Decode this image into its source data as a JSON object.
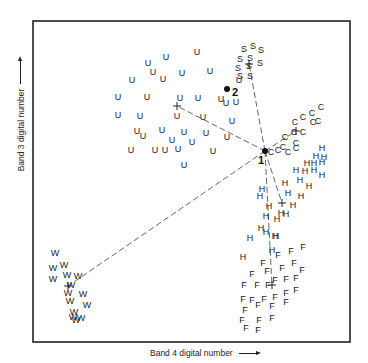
{
  "chart_data": {
    "type": "scatter",
    "title": "",
    "xlabel": "Band 4 digital number",
    "ylabel": "Band 3 digital number",
    "grid": false,
    "legend": null,
    "frame": {
      "left": 33,
      "top": 21,
      "right": 350,
      "bottom": 342
    },
    "series": [
      {
        "name": "U",
        "marker": "U",
        "centroid": [
          177,
          106
        ],
        "points": [
          [
            148,
            63
          ],
          [
            166,
            57
          ],
          [
            197,
            52
          ],
          [
            153,
            72
          ],
          [
            182,
            73
          ],
          [
            210,
            71
          ],
          [
            132,
            80
          ],
          [
            163,
            79
          ],
          [
            239,
            80
          ],
          [
            118,
            97
          ],
          [
            147,
            97
          ],
          [
            180,
            98
          ],
          [
            198,
            98
          ],
          [
            221,
            99
          ],
          [
            118,
            115
          ],
          [
            140,
            116
          ],
          [
            177,
            116
          ],
          [
            203,
            117
          ],
          [
            232,
            121
          ],
          [
            137,
            131
          ],
          [
            162,
            130
          ],
          [
            184,
            132
          ],
          [
            206,
            133
          ],
          [
            227,
            137
          ],
          [
            143,
            136
          ],
          [
            172,
            140
          ],
          [
            192,
            142
          ],
          [
            131,
            150
          ],
          [
            155,
            150
          ],
          [
            178,
            149
          ],
          [
            213,
            151
          ],
          [
            184,
            165
          ],
          [
            165,
            150
          ],
          [
            236,
            102
          ],
          [
            226,
            103
          ]
        ]
      },
      {
        "name": "S",
        "marker": "S",
        "centroid": [
          249,
          64
        ],
        "points": [
          [
            244,
            49
          ],
          [
            253,
            46
          ],
          [
            261,
            50
          ],
          [
            240,
            59
          ],
          [
            250,
            58
          ],
          [
            260,
            63
          ],
          [
            238,
            68
          ],
          [
            249,
            66
          ],
          [
            240,
            76
          ],
          [
            250,
            76
          ]
        ]
      },
      {
        "name": "C",
        "marker": "C",
        "centroid": [
          296,
          131
        ],
        "points": [
          [
            321,
            107
          ],
          [
            312,
            113
          ],
          [
            303,
            117
          ],
          [
            295,
            122
          ],
          [
            313,
            122
          ],
          [
            318,
            121
          ],
          [
            294,
            132
          ],
          [
            303,
            132
          ],
          [
            285,
            137
          ],
          [
            296,
            143
          ],
          [
            283,
            147
          ],
          [
            278,
            150
          ],
          [
            288,
            152
          ],
          [
            296,
            148
          ],
          [
            271,
            152
          ]
        ]
      },
      {
        "name": "H",
        "marker": "H",
        "centroid": [
          282,
          203
        ],
        "points": [
          [
            322,
            148
          ],
          [
            316,
            156
          ],
          [
            324,
            157
          ],
          [
            307,
            163
          ],
          [
            314,
            163
          ],
          [
            322,
            162
          ],
          [
            305,
            171
          ],
          [
            314,
            170
          ],
          [
            322,
            175
          ],
          [
            296,
            170
          ],
          [
            300,
            180
          ],
          [
            309,
            186
          ],
          [
            285,
            183
          ],
          [
            288,
            193
          ],
          [
            301,
            196
          ],
          [
            262,
            189
          ],
          [
            260,
            196
          ],
          [
            293,
            205
          ],
          [
            269,
            206
          ],
          [
            281,
            213
          ],
          [
            286,
            214
          ],
          [
            277,
            219
          ],
          [
            266,
            216
          ],
          [
            261,
            228
          ],
          [
            266,
            232
          ],
          [
            250,
            238
          ],
          [
            276,
            236
          ],
          [
            272,
            250
          ],
          [
            243,
            257
          ],
          [
            275,
            236
          ]
        ]
      },
      {
        "name": "F",
        "marker": "F",
        "centroid": [
          272,
          285
        ],
        "points": [
          [
            278,
            255
          ],
          [
            291,
            251
          ],
          [
            303,
            247
          ],
          [
            263,
            263
          ],
          [
            282,
            268
          ],
          [
            294,
            263
          ],
          [
            302,
            270
          ],
          [
            267,
            271
          ],
          [
            275,
            280
          ],
          [
            286,
            279
          ],
          [
            296,
            278
          ],
          [
            252,
            274
          ],
          [
            244,
            285
          ],
          [
            257,
            285
          ],
          [
            268,
            285
          ],
          [
            252,
            300
          ],
          [
            264,
            299
          ],
          [
            275,
            297
          ],
          [
            286,
            293
          ],
          [
            296,
            290
          ],
          [
            243,
            299
          ],
          [
            245,
            310
          ],
          [
            258,
            305
          ],
          [
            272,
            306
          ],
          [
            286,
            302
          ],
          [
            259,
            320
          ],
          [
            242,
            320
          ],
          [
            272,
            318
          ],
          [
            246,
            328
          ],
          [
            258,
            330
          ]
        ]
      },
      {
        "name": "W",
        "marker": "W",
        "centroid": [
          68,
          286
        ],
        "points": [
          [
            55,
            253
          ],
          [
            53,
            268
          ],
          [
            64,
            265
          ],
          [
            53,
            279
          ],
          [
            67,
            275
          ],
          [
            78,
            276
          ],
          [
            71,
            285
          ],
          [
            68,
            293
          ],
          [
            83,
            294
          ],
          [
            70,
            301
          ],
          [
            87,
            305
          ],
          [
            74,
            312
          ],
          [
            76,
            320
          ],
          [
            81,
            318
          ],
          [
            73,
            317
          ]
        ]
      }
    ],
    "annotations": [
      {
        "label": "1",
        "point": [
          265,
          151
        ],
        "text_pos": [
          258,
          164
        ]
      },
      {
        "label": "2",
        "point": [
          227,
          89
        ],
        "text_pos": [
          232,
          96
        ]
      }
    ],
    "lines_from_point_1": [
      "U",
      "S",
      "C",
      "H",
      "F",
      "W"
    ]
  }
}
